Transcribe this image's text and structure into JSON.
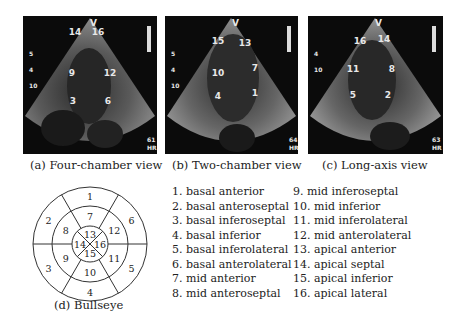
{
  "panels": [
    {
      "id": "a",
      "caption": "(a) Four-chamber view",
      "marker": "V",
      "labels": [
        {
          "t": "14",
          "x": 52,
          "y": 19
        },
        {
          "t": "16",
          "x": 75,
          "y": 19
        },
        {
          "t": "9",
          "x": 49,
          "y": 60
        },
        {
          "t": "12",
          "x": 87,
          "y": 60
        },
        {
          "t": "3",
          "x": 50,
          "y": 88
        },
        {
          "t": "6",
          "x": 85,
          "y": 88
        }
      ],
      "side_labels": [
        "5",
        "4",
        "10"
      ],
      "corner": [
        "61",
        "HR"
      ]
    },
    {
      "id": "b",
      "caption": "(b) Two-chamber view",
      "marker": "V",
      "labels": [
        {
          "t": "15",
          "x": 53,
          "y": 28
        },
        {
          "t": "13",
          "x": 80,
          "y": 30
        },
        {
          "t": "10",
          "x": 53,
          "y": 60
        },
        {
          "t": "7",
          "x": 90,
          "y": 55
        },
        {
          "t": "4",
          "x": 53,
          "y": 83
        },
        {
          "t": "1",
          "x": 90,
          "y": 80
        }
      ],
      "side_labels": [
        "5",
        "4",
        "10"
      ],
      "corner": [
        "64",
        "HR"
      ]
    },
    {
      "id": "c",
      "caption": "(c) Long-axis view",
      "marker": "V",
      "labels": [
        {
          "t": "16",
          "x": 52,
          "y": 28
        },
        {
          "t": "14",
          "x": 76,
          "y": 26
        },
        {
          "t": "11",
          "x": 45,
          "y": 56
        },
        {
          "t": "8",
          "x": 84,
          "y": 56
        },
        {
          "t": "5",
          "x": 45,
          "y": 82
        },
        {
          "t": "2",
          "x": 80,
          "y": 82
        }
      ],
      "side_labels": [
        "4",
        "10"
      ],
      "corner": [
        "63",
        "HR"
      ]
    }
  ],
  "bullseye": {
    "caption": "(d) Bullseye",
    "segments": [
      "1",
      "2",
      "3",
      "4",
      "5",
      "6",
      "7",
      "8",
      "9",
      "10",
      "11",
      "12",
      "13",
      "14",
      "15",
      "16"
    ]
  },
  "legend": {
    "col1": [
      "1. basal anterior",
      "2. basal anteroseptal",
      "3. basal inferoseptal",
      "4. basal inferior",
      "5. basal inferolateral",
      "6. basal anterolateral",
      "7. mid anterior",
      "8. mid anteroseptal"
    ],
    "col2": [
      "9. mid inferoseptal",
      "10. mid inferior",
      "11. mid inferolateral",
      "12. mid anterolateral",
      "13. apical anterior",
      "14. apical septal",
      "15. apical inferior",
      "16. apical lateral"
    ]
  }
}
